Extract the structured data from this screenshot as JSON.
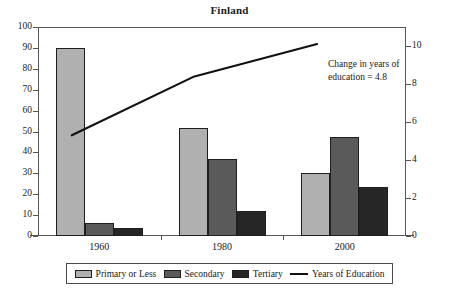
{
  "chart_data": {
    "type": "bar",
    "title": "Finland",
    "xlabel": "",
    "ylabel": "",
    "categories": [
      "1960",
      "1980",
      "2000"
    ],
    "series": [
      {
        "name": "Primary or Less",
        "values": [
          90,
          51.5,
          30
        ],
        "color": "#b0b0b0",
        "axis": "left"
      },
      {
        "name": "Secondary",
        "values": [
          6,
          37,
          47.5
        ],
        "color": "#5a5a5a",
        "axis": "left"
      },
      {
        "name": "Tertiary",
        "values": [
          4,
          12,
          23.5
        ],
        "color": "#262626",
        "axis": "left"
      },
      {
        "name": "Years of Education",
        "values": [
          5.3,
          8.4,
          10.1
        ],
        "color": "#111111",
        "axis": "right",
        "type": "line"
      }
    ],
    "ylim": [
      0,
      100
    ],
    "ytick_labels": [
      "0",
      "10",
      "20",
      "30",
      "40",
      "50",
      "60",
      "70",
      "80",
      "90",
      "100"
    ],
    "y2lim": [
      0,
      11
    ],
    "y2tick_labels": [
      "0",
      "2",
      "4",
      "6",
      "8",
      "10"
    ],
    "grid": false,
    "legend_position": "bottom",
    "annotations": [
      {
        "line1": "Change in years of",
        "line2": "education = 4.8"
      }
    ]
  },
  "annotation": {
    "line1": "Change in years of",
    "line2": "education = 4.8"
  },
  "legend": {
    "items": [
      {
        "label": "Primary or Less",
        "marker": "swatch",
        "color": "#b0b0b0"
      },
      {
        "label": "Secondary",
        "marker": "swatch",
        "color": "#5a5a5a"
      },
      {
        "label": "Tertiary",
        "marker": "swatch",
        "color": "#262626"
      },
      {
        "label": "Years of Education",
        "marker": "line",
        "color": "#111111"
      }
    ]
  }
}
